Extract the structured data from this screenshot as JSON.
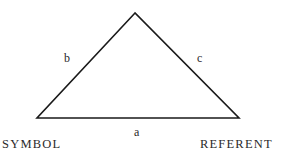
{
  "diagram": {
    "type": "semiotic-triangle",
    "colors": {
      "line": "#1a1a1a",
      "text": "#2a2a2a",
      "background": "#ffffff"
    },
    "vertices": {
      "apex": {
        "x": 135,
        "y": 13
      },
      "left": {
        "x": 37,
        "y": 118,
        "label": "SYMBOL"
      },
      "right": {
        "x": 239,
        "y": 118,
        "label": "REFERENT"
      }
    },
    "edges": [
      {
        "id": "a",
        "label": "a",
        "from": "left",
        "to": "right"
      },
      {
        "id": "b",
        "label": "b",
        "from": "left",
        "to": "apex"
      },
      {
        "id": "c",
        "label": "c",
        "from": "apex",
        "to": "right"
      }
    ]
  }
}
